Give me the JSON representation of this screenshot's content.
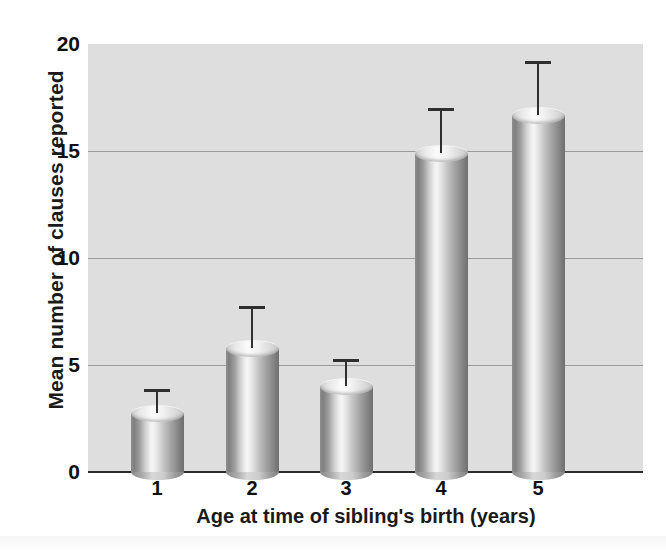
{
  "chart_data": {
    "type": "bar",
    "title": "",
    "xlabel": "Age at time of sibling's birth (years)",
    "ylabel": "Mean number of clauses reported",
    "categories": [
      "1",
      "2",
      "3",
      "4",
      "5"
    ],
    "values": [
      2.75,
      5.8,
      4.0,
      14.9,
      16.7
    ],
    "error_upper": [
      3.9,
      7.75,
      5.3,
      17.0,
      19.2
    ],
    "error_bars": [
      1.15,
      1.95,
      1.3,
      2.1,
      2.5
    ],
    "ylim": [
      0,
      20
    ],
    "yticks": [
      0,
      5,
      10,
      15,
      20
    ],
    "ytick_labels": [
      "0",
      "5",
      "10",
      "15",
      "20"
    ],
    "grid": true,
    "grid_axis": "y",
    "legend": "none",
    "bar_style": "cylinder",
    "colors": {
      "plot_background": "#dedede",
      "gridline": "#9b9b9b",
      "axis": "#2b2b2b",
      "bar_light": "#f6f6f6",
      "bar_dark": "#6f6f6f",
      "text": "#111111"
    }
  },
  "axes": {
    "y_title": "Mean number of clauses reported",
    "x_title": "Age at time of sibling's birth (years)",
    "y_tick_labels": [
      "20",
      "15",
      "10",
      "5",
      "0"
    ],
    "x_tick_labels": [
      "1",
      "2",
      "3",
      "4",
      "5"
    ]
  }
}
